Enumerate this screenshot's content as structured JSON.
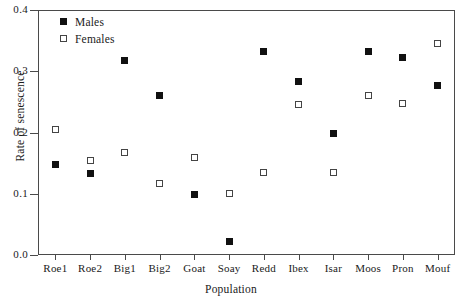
{
  "chart_data": {
    "type": "scatter",
    "title": "",
    "xlabel": "Population",
    "ylabel": "Rate of senescence",
    "categories": [
      "Roe1",
      "Roe2",
      "Big1",
      "Big2",
      "Goat",
      "Soay",
      "Redd",
      "Ibex",
      "Isar",
      "Moos",
      "Pron",
      "Mouf"
    ],
    "ylim": [
      0.0,
      0.4
    ],
    "ytick_labels": [
      "0.0",
      "0.1",
      "0.2",
      "0.3",
      "0.4"
    ],
    "ytick_values": [
      0.0,
      0.1,
      0.2,
      0.3,
      0.4
    ],
    "grid": false,
    "legend_position": "top-left",
    "series": [
      {
        "name": "Males",
        "marker": "filled-square",
        "color": "#111111",
        "values": [
          0.148,
          0.133,
          0.318,
          0.261,
          0.098,
          0.022,
          0.333,
          0.283,
          0.198,
          0.333,
          0.322,
          0.277
        ]
      },
      {
        "name": "Females",
        "marker": "open-square",
        "color": "#ffffff",
        "values": [
          0.205,
          0.155,
          0.167,
          0.117,
          0.16,
          0.1,
          0.134,
          0.245,
          0.134,
          0.261,
          0.248,
          0.345
        ]
      }
    ]
  }
}
